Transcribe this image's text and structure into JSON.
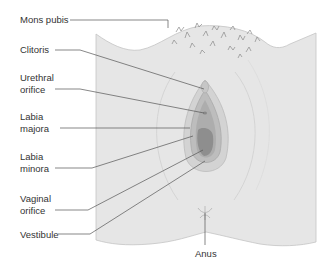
{
  "diagram": {
    "type": "anatomical-illustration",
    "labels": {
      "mons_pubis": "Mons pubis",
      "clitoris": "Clitoris",
      "urethral_orifice_1": "Urethral",
      "urethral_orifice_2": "orifice",
      "labia_majora_1": "Labia",
      "labia_majora_2": "majora",
      "labia_minora_1": "Labia",
      "labia_minora_2": "minora",
      "vaginal_orifice_1": "Vaginal",
      "vaginal_orifice_2": "orifice",
      "vestibule": "Vestibule",
      "anus": "Anus"
    },
    "colors": {
      "skin": "#e6e6e6",
      "skin_edge": "#bdbdbd",
      "labia_majora": "#cfcfcf",
      "labia_minora": "#b8b8b8",
      "vestibule": "#a9a9a9",
      "vaginal_orifice": "#8e8e8e",
      "leader_line": "#555555",
      "hair": "#8a8a8a"
    }
  }
}
